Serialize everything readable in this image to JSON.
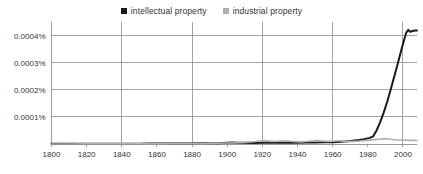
{
  "chart_data": {
    "type": "line",
    "title": "",
    "subtitle": "",
    "xlabel": "",
    "ylabel": "",
    "xlim": [
      1800,
      2008
    ],
    "ylim": [
      0,
      0.00045
    ],
    "grid": true,
    "legend_position": "top-center",
    "x_tick_labels": [
      "1800",
      "1820",
      "1840",
      "1860",
      "1880",
      "1900",
      "1920",
      "1940",
      "1960",
      "1980",
      "2000"
    ],
    "x_tick_values": [
      1800,
      1820,
      1840,
      1860,
      1880,
      1900,
      1920,
      1940,
      1960,
      1980,
      2000
    ],
    "x_gridline_values": [
      1840,
      1880,
      1920,
      1960,
      2000
    ],
    "y_tick_labels": [
      "0.0001%",
      "0.0002%",
      "0.0003%",
      "0.0004%"
    ],
    "y_tick_values": [
      0.0001,
      0.0002,
      0.0003,
      0.0004
    ],
    "series": [
      {
        "name": "intellectual property",
        "color": "#1a1a1a",
        "x": [
          1800,
          1805,
          1810,
          1815,
          1820,
          1825,
          1830,
          1835,
          1840,
          1845,
          1850,
          1855,
          1860,
          1865,
          1870,
          1875,
          1880,
          1885,
          1890,
          1895,
          1900,
          1903,
          1906,
          1910,
          1915,
          1920,
          1925,
          1930,
          1935,
          1940,
          1945,
          1950,
          1955,
          1960,
          1965,
          1970,
          1975,
          1978,
          1981,
          1983,
          1985,
          1987,
          1989,
          1991,
          1993,
          1995,
          1997,
          1999,
          2001,
          2002,
          2003,
          2004,
          2005,
          2006,
          2007,
          2008
        ],
        "values": [
          5e-07,
          5e-07,
          6e-07,
          6e-07,
          7e-07,
          8e-07,
          8e-07,
          1e-06,
          1e-06,
          1.2e-06,
          1.2e-06,
          1.4e-06,
          1.5e-06,
          1.6e-06,
          1.8e-06,
          2e-06,
          2.2e-06,
          2.5e-06,
          2.8e-06,
          3e-06,
          4.5e-06,
          5.5e-06,
          4.8e-06,
          4.2e-06,
          4e-06,
          4.2e-06,
          4.5e-06,
          4.8e-06,
          4.8e-06,
          5e-06,
          5.2e-06,
          5.8e-06,
          6.2e-06,
          6.8e-06,
          8.5e-06,
          1.1e-05,
          1.45e-05,
          1.75e-05,
          2.25e-05,
          2.75e-05,
          5e-05,
          8e-05,
          0.000115,
          0.000155,
          0.0002,
          0.000248,
          0.000295,
          0.000345,
          0.000392,
          0.000412,
          0.000421,
          0.000414,
          0.000416,
          0.000418,
          0.000419,
          0.000419
        ]
      },
      {
        "name": "industrial property",
        "color": "#b0b0b0",
        "x": [
          1800,
          1810,
          1820,
          1830,
          1840,
          1850,
          1860,
          1870,
          1880,
          1885,
          1890,
          1895,
          1900,
          1905,
          1910,
          1915,
          1918,
          1921,
          1924,
          1927,
          1930,
          1933,
          1936,
          1939,
          1942,
          1945,
          1948,
          1951,
          1954,
          1957,
          1960,
          1963,
          1966,
          1969,
          1972,
          1975,
          1978,
          1981,
          1984,
          1987,
          1990,
          1992,
          1994,
          1996,
          1998,
          2000,
          2002,
          2004,
          2006,
          2008
        ],
        "values": [
          2e-07,
          2e-07,
          3e-07,
          3e-07,
          4e-07,
          5e-07,
          6e-07,
          8e-07,
          1e-06,
          1.5e-06,
          2.2e-06,
          2.8e-06,
          3.5e-06,
          4.8e-06,
          6.2e-06,
          8.5e-06,
          1.1e-05,
          1.25e-05,
          1.05e-05,
          9e-06,
          1.08e-05,
          1.22e-05,
          1.02e-05,
          8.8e-06,
          7.8e-06,
          9.2e-06,
          1.12e-05,
          1.25e-05,
          1.12e-05,
          9.8e-06,
          1.02e-05,
          1.18e-05,
          1.05e-05,
          9.2e-06,
          9.8e-06,
          1.08e-05,
          1.25e-05,
          1.42e-05,
          1.62e-05,
          1.85e-05,
          1.95e-05,
          1.82e-05,
          1.65e-05,
          1.52e-05,
          1.45e-05,
          1.42e-05,
          1.38e-05,
          1.35e-05,
          1.32e-05,
          1.3e-05
        ]
      }
    ]
  },
  "legend": {
    "items": [
      {
        "label": "intellectual property",
        "color": "#1a1a1a"
      },
      {
        "label": "industrial property",
        "color": "#b0b0b0"
      }
    ]
  },
  "axes": {
    "axis_color": "#999999",
    "grid_color": "#999999",
    "tick_text_color": "#333333"
  }
}
